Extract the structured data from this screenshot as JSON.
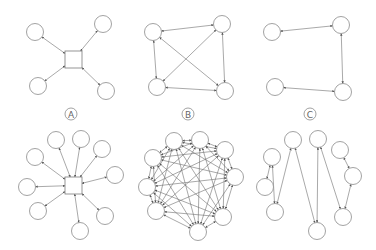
{
  "figure": {
    "labels": [
      {
        "id": "A",
        "text": "A",
        "x": 71,
        "y": 114
      },
      {
        "id": "B",
        "text": "B",
        "x": 188,
        "y": 114
      },
      {
        "id": "C",
        "text": "C",
        "x": 310,
        "y": 114
      }
    ],
    "colors": {
      "stroke": "#6e6e6e",
      "node_stroke": "#8a8a8a",
      "background": "#ffffff"
    },
    "node_radius": 8.5,
    "panels": [
      {
        "name": "top-a-hub",
        "hub": {
          "x": 65,
          "y": 51,
          "w": 17,
          "h": 17
        },
        "nodes": [
          [
            35,
            32
          ],
          [
            103,
            24
          ],
          [
            38,
            86
          ],
          [
            106,
            91
          ]
        ],
        "edges": "hub"
      },
      {
        "name": "top-b-mesh",
        "nodes": [
          [
            153,
            32
          ],
          [
            222,
            24
          ],
          [
            157,
            87
          ],
          [
            225,
            91
          ]
        ],
        "edges": "complete"
      },
      {
        "name": "top-c-chain",
        "nodes": [
          [
            272,
            32
          ],
          [
            341,
            25
          ],
          [
            343,
            92
          ],
          [
            275,
            87
          ]
        ],
        "edges": [
          [
            0,
            1
          ],
          [
            1,
            2
          ],
          [
            2,
            3
          ]
        ]
      },
      {
        "name": "bottom-a-hub",
        "hub": {
          "x": 65,
          "y": 177,
          "w": 17,
          "h": 17
        },
        "nodes": [
          [
            56,
            140
          ],
          [
            81,
            139
          ],
          [
            102,
            149
          ],
          [
            115,
            175
          ],
          [
            35,
            157
          ],
          [
            27,
            187
          ],
          [
            38,
            211
          ],
          [
            80,
            231
          ],
          [
            105,
            216
          ]
        ],
        "edges": "hub"
      },
      {
        "name": "bottom-b-mesh",
        "nodes": [
          [
            174,
            141
          ],
          [
            200,
            140
          ],
          [
            225,
            150
          ],
          [
            153,
            158
          ],
          [
            235,
            177
          ],
          [
            147,
            187
          ],
          [
            156,
            211
          ],
          [
            223,
            217
          ],
          [
            198,
            232
          ]
        ],
        "edges": "complete"
      },
      {
        "name": "bottom-c-chain",
        "nodes": [
          [
            265,
            187
          ],
          [
            272,
            157
          ],
          [
            275,
            212
          ],
          [
            293,
            140
          ],
          [
            317,
            231
          ],
          [
            318,
            139
          ],
          [
            343,
            217
          ],
          [
            353,
            176
          ],
          [
            340,
            150
          ]
        ],
        "edges": [
          [
            0,
            1
          ],
          [
            1,
            2
          ],
          [
            2,
            3
          ],
          [
            3,
            4
          ],
          [
            4,
            5
          ],
          [
            5,
            6
          ],
          [
            6,
            7
          ],
          [
            7,
            8
          ]
        ]
      }
    ]
  }
}
